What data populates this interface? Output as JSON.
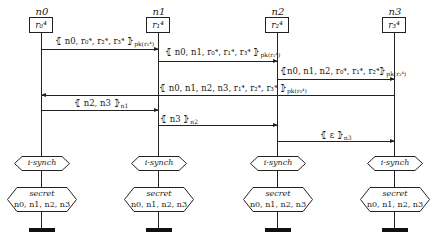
{
  "nodes": [
    {
      "name": "n0",
      "state": "r₀⁴"
    },
    {
      "name": "n1",
      "state": "r₁⁴"
    },
    {
      "name": "n2",
      "state": "r₂⁴"
    },
    {
      "name": "n3",
      "state": "r₃⁴"
    }
  ],
  "messages": [
    {
      "from": "n0",
      "to": "n1",
      "label": "⦃ n0, r₀⁴, r₂⁴, r₃⁴ ⦄",
      "key": "pk(r₁⁴)"
    },
    {
      "from": "n1",
      "to": "n2",
      "label": "⦃ n0, n1, r₀⁴, r₁⁴, r₃⁴ ⦄",
      "key": "pk(r₂⁴)"
    },
    {
      "from": "n2",
      "to": "n3",
      "label": "⦃n0, n1, n2, r₀⁴, r₁⁴, r₂⁴⦄",
      "key": "pk(r₃⁴)"
    },
    {
      "from": "n3",
      "to": "n0",
      "label": "⦃ n0, n1, n2, n3, r₁⁴, r₂⁴, r₃⁴ ⦄",
      "key": "pk(r₀⁴)"
    },
    {
      "from": "n0",
      "to": "n1",
      "label": "⦃ n2, n3 ⦄",
      "key": "n1"
    },
    {
      "from": "n1",
      "to": "n2",
      "label": "⦃ n3 ⦄",
      "key": "n2"
    },
    {
      "from": "n2",
      "to": "n3",
      "label": "⦃ ε ⦄",
      "key": "n3"
    }
  ],
  "claims": {
    "isynch": "i-synch",
    "secret_title": "secret",
    "secret_terms": "n0, n1, n2, n3"
  }
}
